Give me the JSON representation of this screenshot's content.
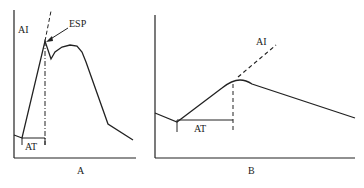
{
  "panels": [
    {
      "id": "A",
      "caption": "A",
      "labels": {
        "y_axis": "AI",
        "point": "ESP",
        "interval": "AT"
      }
    },
    {
      "id": "B",
      "caption": "B",
      "labels": {
        "line": "AI",
        "interval": "AT"
      }
    }
  ],
  "colors": {
    "line": "#222222",
    "background": "#ffffff"
  }
}
